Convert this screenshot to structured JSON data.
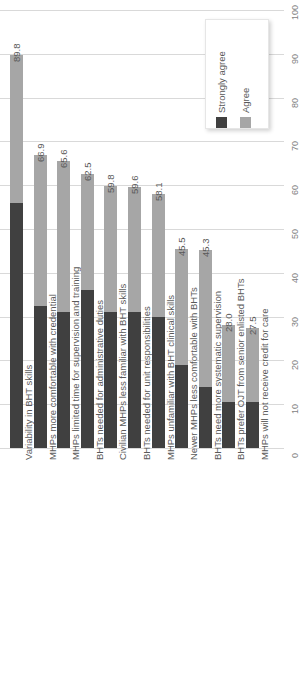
{
  "chart_data": {
    "type": "bar",
    "orientation": "vertical-rotated",
    "stacked": true,
    "title": "",
    "xlabel": "",
    "ylabel": "",
    "ylim": [
      0,
      100
    ],
    "grid": true,
    "legend_position": "top-right",
    "axis_ticks": [
      "0",
      "10",
      "20",
      "30",
      "40",
      "50",
      "60",
      "70",
      "80",
      "90",
      "100"
    ],
    "categories": [
      "Variability in BHT skills",
      "MHPs more comfortable with credential",
      "MHPs limited time for supervision and training",
      "BHTs needed for administrative duties",
      "Civilian MHPs less familiar with BHT skills",
      "BHTs needed for unit responsibilities",
      "MHPs unfamiliar with BHT clinical skills",
      "Newer MHPs less comfortable with BHTs",
      "BHTs need more systematic supervision",
      "BHTs prefer OJT from senior enlisted BHTs",
      "MHPs will not receive credit for care"
    ],
    "series": [
      {
        "name": "Strongly agree",
        "color": "#404040",
        "values": [
          56.0,
          32.5,
          31.0,
          36.0,
          31.0,
          31.0,
          30.0,
          19.0,
          14.0,
          10.5,
          10.5
        ]
      },
      {
        "name": "Agree",
        "color": "#a6a6a6",
        "values": [
          33.8,
          34.4,
          34.6,
          26.5,
          28.8,
          28.6,
          28.1,
          26.5,
          31.3,
          17.5,
          17.0
        ]
      }
    ],
    "totals": [
      89.8,
      66.9,
      65.6,
      62.5,
      59.8,
      59.6,
      58.1,
      45.5,
      45.3,
      28.0,
      27.5
    ],
    "total_labels": [
      "89.8",
      "66.9",
      "65.6",
      "62.5",
      "59.8",
      "59.6",
      "58.1",
      "45.5",
      "45.3",
      "28.0",
      "27.5"
    ]
  },
  "legend": {
    "entries": [
      {
        "label": "Strongly agree",
        "color": "#404040"
      },
      {
        "label": "Agree",
        "color": "#a6a6a6"
      }
    ]
  },
  "colors": {
    "strongly_agree": "#404040",
    "agree": "#a6a6a6",
    "gridline": "#d9d9d9",
    "text": "#595959",
    "background": "#ffffff"
  }
}
